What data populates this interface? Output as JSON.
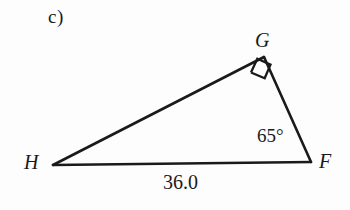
{
  "figure": {
    "part_label": "c)",
    "type": "right-triangle-diagram",
    "stroke_color": "#1a1a1a",
    "background_color": "#fdfdfd",
    "vertices": {
      "G": {
        "label": "G",
        "x": 264,
        "y": 57
      },
      "H": {
        "label": "H",
        "x": 53,
        "y": 165
      },
      "F": {
        "label": "F",
        "x": 311,
        "y": 162
      }
    },
    "angles": [
      {
        "at": "G",
        "label": "",
        "value": "90",
        "marker": "right-angle-square"
      },
      {
        "at": "F",
        "label": "65°",
        "value": "65"
      }
    ],
    "sides": [
      {
        "from": "H",
        "to": "F",
        "label": "36.0"
      },
      {
        "from": "H",
        "to": "G",
        "label": ""
      },
      {
        "from": "G",
        "to": "F",
        "label": ""
      }
    ]
  }
}
